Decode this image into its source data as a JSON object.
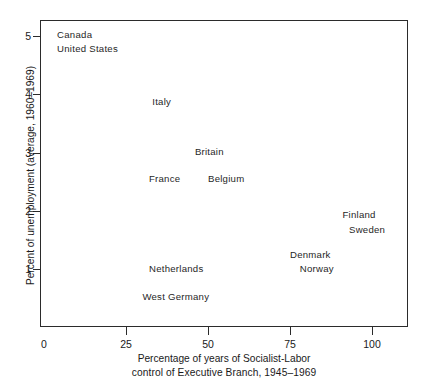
{
  "chart_data": {
    "type": "scatter",
    "title": "",
    "xlabel": "Percentage of years of Socialist-Labor control of Executive Branch, 1945–1969",
    "xlabel_line1": "Percentage of years of Socialist-Labor",
    "xlabel_line2": "control of Executive Branch, 1945–1969",
    "ylabel": "Percent of unemployment (average, 1960–1969)",
    "xlim": [
      0,
      111
    ],
    "ylim": [
      0,
      5.28
    ],
    "grid": false,
    "legend": null,
    "xticks": [
      0,
      25,
      50,
      75,
      100
    ],
    "xtick_labels": [
      "0",
      "25",
      "50",
      "75",
      "100"
    ],
    "yticks": [
      1,
      2,
      3,
      4,
      5
    ],
    "ytick_labels": [
      "1",
      "2",
      "3",
      "4",
      "5"
    ],
    "marker_style": "text-label-only",
    "points": [
      {
        "label": "Canada",
        "x": 4,
        "y": 5.02
      },
      {
        "label": "United States",
        "x": 4,
        "y": 4.78
      },
      {
        "label": "Italy",
        "x": 33,
        "y": 3.87
      },
      {
        "label": "Britain",
        "x": 46,
        "y": 3.02
      },
      {
        "label": "France",
        "x": 32,
        "y": 2.56
      },
      {
        "label": "Belgium",
        "x": 50,
        "y": 2.56
      },
      {
        "label": "Finland",
        "x": 91,
        "y": 1.93
      },
      {
        "label": "Sweden",
        "x": 93,
        "y": 1.68
      },
      {
        "label": "Denmark",
        "x": 75,
        "y": 1.25
      },
      {
        "label": "Norway",
        "x": 78,
        "y": 1.01
      },
      {
        "label": "Netherlands",
        "x": 32,
        "y": 1.0
      },
      {
        "label": "West Germany",
        "x": 30,
        "y": 0.52
      }
    ]
  },
  "colors": {
    "axis": "#2b2b2b",
    "text": "#1a1a1a",
    "background": "#ffffff"
  }
}
